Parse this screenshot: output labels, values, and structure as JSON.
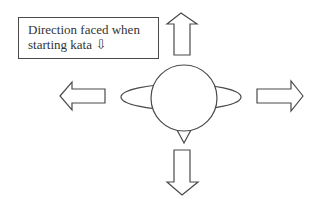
{
  "diagram": {
    "type": "kata-direction-diagram",
    "label": {
      "line1": "Direction faced when",
      "line2": "starting kata ⇩"
    },
    "arrows": [
      {
        "direction": "up"
      },
      {
        "direction": "left"
      },
      {
        "direction": "right"
      },
      {
        "direction": "down"
      }
    ],
    "figure": {
      "head": "circle",
      "shoulders": "ellipse",
      "nose": "triangle pointing down"
    },
    "colors": {
      "stroke": "#4a4a4a",
      "fill": "#ffffff",
      "text": "#333333"
    }
  }
}
